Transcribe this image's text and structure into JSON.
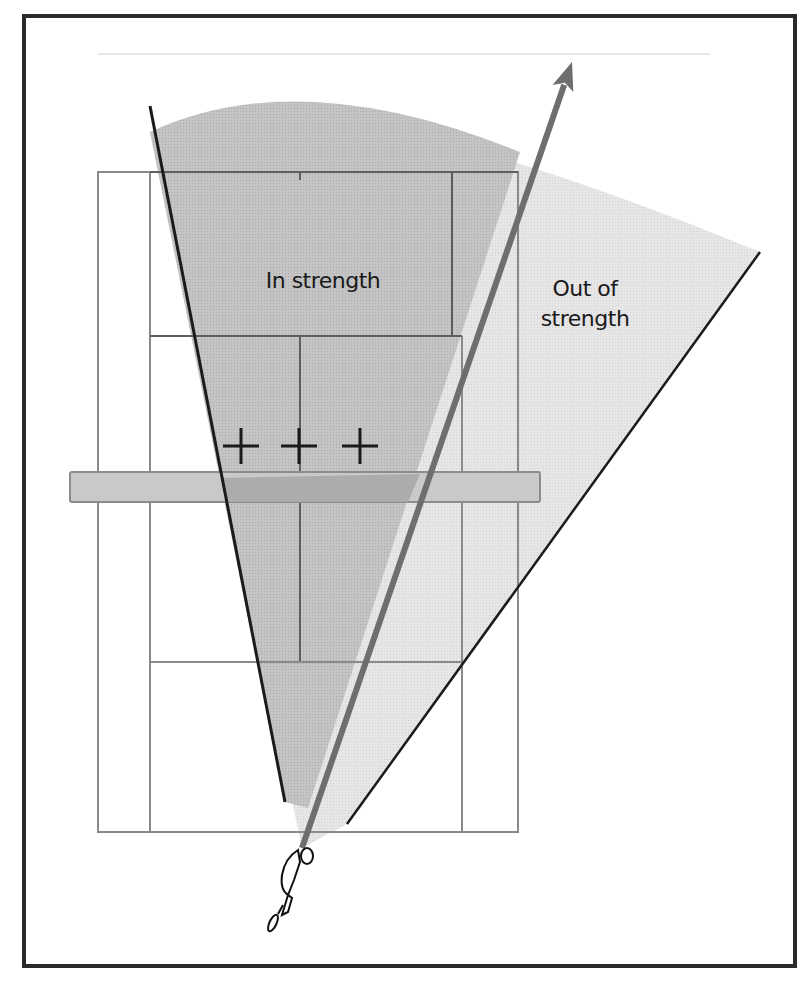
{
  "figure": {
    "width": 809,
    "height": 983,
    "frame": {
      "x": 24,
      "y": 16,
      "w": 771,
      "h": 950,
      "stroke": "#2a2a2a",
      "stroke_width": 4
    },
    "top_rule": {
      "x1": 98,
      "y1": 54,
      "x2": 710,
      "y2": 54,
      "stroke": "#cfcfcf"
    }
  },
  "colors": {
    "in_strength_fill": "#b9b9b9",
    "out_strength_fill": "#e2e2e2",
    "court_line": "#8a8a8a",
    "inner_line": "#5e5e5e",
    "net_band_fill": "#c9c9c9",
    "net_band_overlap": "#a8a8a8",
    "wedge_line": "#1b1b1b",
    "arrow": "#6e6e6e",
    "cross": "#1a1a1a"
  },
  "zones": {
    "out_of_strength": {
      "label_line1": "Out of",
      "label_line2": "strength",
      "label_x": 585,
      "label_y1": 296,
      "label_y2": 326
    },
    "in_strength": {
      "label": "In strength",
      "label_x": 323,
      "label_y": 288
    }
  },
  "wedges": {
    "left_edge": {
      "x1": 150,
      "y1": 106,
      "x2": 285,
      "y2": 802
    },
    "right_edge": {
      "x1": 760,
      "y1": 252,
      "x2": 347,
      "y2": 824
    },
    "arc_top_peak_y": 92
  },
  "shot_arrow": {
    "x1": 302,
    "y1": 848,
    "x2": 572,
    "y2": 62,
    "width": 6
  },
  "court": {
    "outer": {
      "x1": 98,
      "y1": 172,
      "x2": 518,
      "y2": 832
    },
    "inner_left_x": 150,
    "inner_right_x": 462,
    "top_inner_right_x": 452,
    "top_line_y": 172,
    "short_service_top_y": 336,
    "short_service_bottom_y": 662,
    "net_y": 486,
    "center_x": 300,
    "back_service_bottom_y": 780
  },
  "net_band": {
    "x": 70,
    "y": 472,
    "w": 470,
    "h": 30
  },
  "crosses": [
    {
      "x": 241,
      "y": 446,
      "size": 18
    },
    {
      "x": 299,
      "y": 446,
      "size": 18
    },
    {
      "x": 360,
      "y": 446,
      "size": 18
    }
  ],
  "player": {
    "x": 290,
    "y": 845,
    "label": "player-figure"
  }
}
